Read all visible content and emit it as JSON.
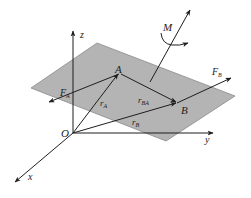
{
  "diagram": {
    "title": "",
    "colors": {
      "plane_fill": "#b4b4b4",
      "plane_stroke": "#8a8a8a",
      "line": "#1e1e1e",
      "background": "#ffffff"
    },
    "axes": {
      "origin_label": "O",
      "x_label": "x",
      "y_label": "y",
      "z_label": "z"
    },
    "points": [
      {
        "id": "A",
        "label": "A"
      },
      {
        "id": "B",
        "label": "B"
      }
    ],
    "vectors": {
      "r_A": {
        "main": "r",
        "sub": "A"
      },
      "r_B": {
        "main": "r",
        "sub": "B"
      },
      "r_BA": {
        "main": "r",
        "sub": "BA"
      },
      "F_A": {
        "main": "F",
        "sub": "A"
      },
      "F_B": {
        "main": "F",
        "sub": "B"
      }
    },
    "moment": {
      "label": "M"
    }
  }
}
